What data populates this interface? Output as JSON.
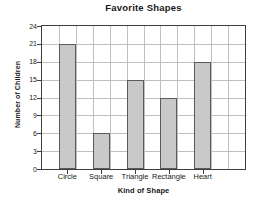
{
  "chart_data": {
    "type": "bar",
    "title": "Favorite Shapes",
    "xlabel": "Kind of Shape",
    "ylabel": "Number of Children",
    "categories": [
      "Circle",
      "Square",
      "Triangle",
      "Rectangle",
      "Heart"
    ],
    "values": [
      21,
      6,
      15,
      12,
      18
    ],
    "yticks": [
      0,
      3,
      6,
      9,
      12,
      15,
      18,
      21,
      24
    ],
    "ylim": [
      0,
      24
    ],
    "grid": "both",
    "legend": "none",
    "colors": {
      "bar_fill": "#c9c9c9",
      "bar_stroke": "#5a5a5a",
      "grid": "#c0c0c0",
      "frame": "#3d3d3d",
      "text": "#1a1a1a",
      "background": "#ffffff"
    }
  }
}
